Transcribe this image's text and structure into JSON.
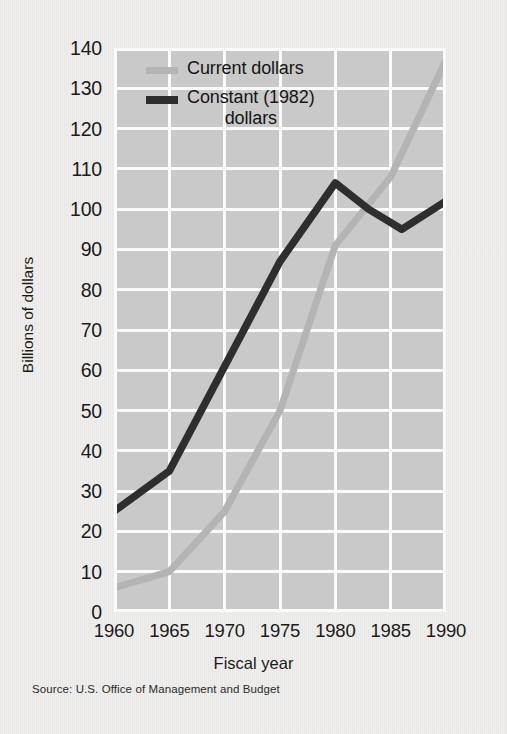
{
  "chart_data": {
    "type": "line",
    "title": "",
    "xlabel": "Fiscal year",
    "ylabel": "Billions of dollars",
    "xlim": [
      1960,
      1990
    ],
    "ylim": [
      0,
      140
    ],
    "ytick_step": 10,
    "xtick_step": 5,
    "grid": true,
    "legend_position": "top-left-inside",
    "xticks": [
      "1960",
      "1965",
      "1970",
      "1975",
      "1980",
      "1985",
      "1990"
    ],
    "yticks": [
      "0",
      "10",
      "20",
      "30",
      "40",
      "50",
      "60",
      "70",
      "80",
      "90",
      "100",
      "110",
      "120",
      "130",
      "140"
    ],
    "series": [
      {
        "name": "Current dollars",
        "color": "#b4b4b4",
        "x": [
          1960,
          1965,
          1970,
          1975,
          1980,
          1985,
          1990
        ],
        "values": [
          6,
          10,
          25,
          50,
          91,
          108,
          137
        ]
      },
      {
        "name": "Constant (1982) dollars",
        "color": "#2e2e2e",
        "x": [
          1960,
          1965,
          1970,
          1975,
          1980,
          1983,
          1986,
          1990
        ],
        "values": [
          25,
          35,
          61,
          87,
          106.5,
          100,
          95,
          102
        ]
      }
    ],
    "source": "Source: U.S. Office of Management and Budget"
  },
  "legend": {
    "items": [
      {
        "label": "Current dollars",
        "label_line2": ""
      },
      {
        "label": "Constant (1982)",
        "label_line2": "dollars"
      }
    ]
  },
  "colors": {
    "page_background": "#efeeec",
    "plot_background": "#c9c9c9",
    "gridline": "#fbfbfa",
    "current_dollars": "#b4b4b4",
    "constant_dollars": "#2e2e2e",
    "text": "#1b1b1b"
  },
  "axis": {
    "y_title": "Billions of dollars",
    "x_title": "Fiscal year"
  },
  "footer": {
    "source": "Source: U.S. Office of Management and Budget"
  }
}
